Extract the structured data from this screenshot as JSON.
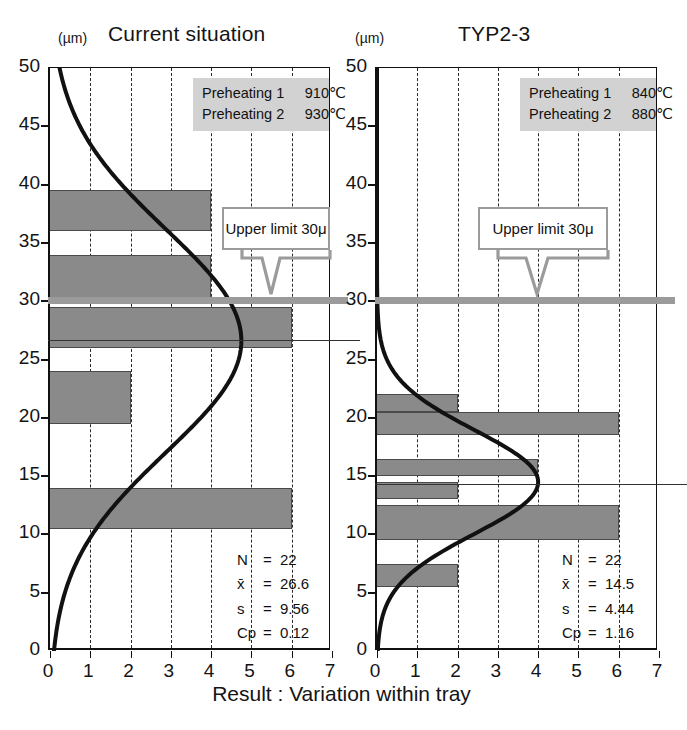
{
  "caption": "Result : Variation within tray",
  "axis_unit": "(µm)",
  "panels": [
    {
      "id": "current",
      "title": "Current situation",
      "info": {
        "rows": [
          {
            "label": "Preheating 1",
            "value": "910℃"
          },
          {
            "label": "Preheating 2",
            "value": "930℃"
          }
        ]
      },
      "callout": "Upper limit 30μ",
      "stats": [
        {
          "key": "N",
          "eq": "=",
          "value": "22"
        },
        {
          "key": "x̄",
          "eq": "=",
          "value": "26.6"
        },
        {
          "key": "s",
          "eq": "=",
          "value": "9.56"
        },
        {
          "key": "Cp",
          "eq": "=",
          "value": "0.12"
        }
      ],
      "chart_data": {
        "type": "bar",
        "orientation": "horizontal",
        "title": "Current situation",
        "xlabel": "",
        "ylabel": "(µm)",
        "xlim": [
          0,
          7
        ],
        "ylim": [
          0,
          50
        ],
        "xticks": [
          0,
          1,
          2,
          3,
          4,
          5,
          6,
          7
        ],
        "yticks": [
          0,
          5,
          10,
          15,
          20,
          25,
          30,
          35,
          40,
          45,
          50
        ],
        "grid": "vertical-dashed",
        "bins": [
          {
            "y0": 36.0,
            "y1": 39.5,
            "count": 4
          },
          {
            "y0": 30.0,
            "y1": 34.0,
            "count": 4
          },
          {
            "y0": 26.0,
            "y1": 29.5,
            "count": 6
          },
          {
            "y0": 19.5,
            "y1": 24.0,
            "count": 2
          },
          {
            "y0": 10.5,
            "y1": 14.0,
            "count": 6
          }
        ],
        "mean_line": 26.6,
        "upper_limit": 30,
        "normal_curve": {
          "mean": 26.6,
          "sd": 9.56,
          "n": 22
        },
        "annotations": [
          "Upper limit 30μ"
        ]
      }
    },
    {
      "id": "typ23",
      "title": "TYP2-3",
      "info": {
        "rows": [
          {
            "label": "Preheating 1",
            "value": "840℃"
          },
          {
            "label": "Preheating 2",
            "value": "880℃"
          }
        ]
      },
      "callout": "Upper limit 30μ",
      "stats": [
        {
          "key": "N",
          "eq": "=",
          "value": "22"
        },
        {
          "key": "x̄",
          "eq": "=",
          "value": "14.5"
        },
        {
          "key": "s",
          "eq": "=",
          "value": "4.44"
        },
        {
          "key": "Cp",
          "eq": "=",
          "value": "1.16"
        }
      ],
      "chart_data": {
        "type": "bar",
        "orientation": "horizontal",
        "title": "TYP2-3",
        "xlabel": "",
        "ylabel": "(µm)",
        "xlim": [
          0,
          7
        ],
        "ylim": [
          0,
          50
        ],
        "xticks": [
          0,
          1,
          2,
          3,
          4,
          5,
          6,
          7
        ],
        "yticks": [
          0,
          5,
          10,
          15,
          20,
          25,
          30,
          35,
          40,
          45,
          50
        ],
        "grid": "vertical-dashed",
        "bins": [
          {
            "y0": 20.5,
            "y1": 22.0,
            "count": 2
          },
          {
            "y0": 18.5,
            "y1": 20.5,
            "count": 6
          },
          {
            "y0": 15.0,
            "y1": 16.5,
            "count": 4
          },
          {
            "y0": 13.0,
            "y1": 14.5,
            "count": 2
          },
          {
            "y0": 9.5,
            "y1": 12.5,
            "count": 6
          },
          {
            "y0": 5.5,
            "y1": 7.5,
            "count": 2
          }
        ],
        "mean_line": 14.2,
        "upper_limit": 30,
        "normal_curve": {
          "mean": 14.5,
          "sd": 4.44,
          "n": 22
        },
        "annotations": [
          "Upper limit 30μ"
        ]
      }
    }
  ],
  "colors": {
    "bar": "#8a8a8a",
    "bar_edge": "#4a4a4a",
    "limit_line": "#9b9b9b",
    "info_bg": "#d2d2d2",
    "axis": "#111111",
    "text": "#141414"
  }
}
